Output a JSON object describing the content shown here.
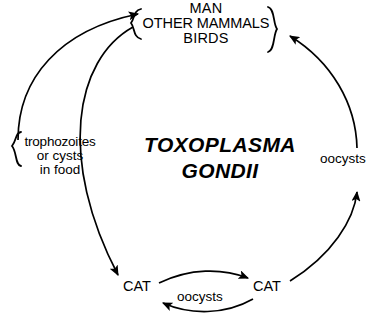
{
  "diagram": {
    "organism": {
      "genus": "TOXOPLASMA",
      "species": "GONDII"
    },
    "hosts": {
      "line1": "MAN",
      "line2": "OTHER MAMMALS",
      "line3": "BIRDS"
    },
    "food_source": {
      "line1": "trophozoites",
      "line2": "or cysts",
      "line3": "in food"
    },
    "definitive_host_left": "CAT",
    "definitive_host_right": "CAT",
    "stage_right": "oocysts",
    "stage_bottom": "oocysts",
    "stroke_color": "#000000",
    "background_color": "#ffffff"
  }
}
